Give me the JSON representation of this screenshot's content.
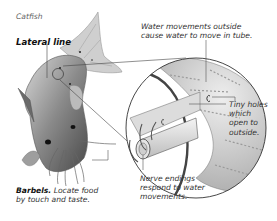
{
  "diagram": {
    "title": "Catfish",
    "labels": {
      "lateral_line": "Lateral line",
      "water_movements": "Water movements outside cause water to move in tube.",
      "water_movements_line1": "Water movements outside",
      "water_movements_line2": "cause water to move in tube.",
      "tiny_holes_line1": "Tiny holes",
      "tiny_holes_line2": "which",
      "tiny_holes_line3": "open to",
      "tiny_holes_line4": "outside.",
      "barbels_bold": "Barbels.",
      "barbels_line1_rest": " Locate food",
      "barbels_line2": "by touch and taste.",
      "nerve_line1": "Nerve endings",
      "nerve_line2": "respond to water",
      "nerve_line3": "movements."
    },
    "colors": {
      "line": "#555555",
      "fish_dark": "#5a5a5a",
      "fish_mid": "#9a9a9a",
      "fish_light": "#d6d6d6",
      "skin": "#c8c8c8",
      "tube": "#e8e8e8"
    }
  }
}
